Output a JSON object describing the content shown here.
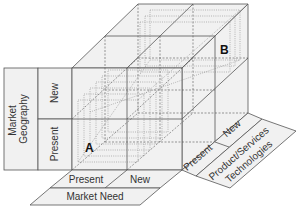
{
  "diagram": {
    "title": "",
    "point_labels": {
      "a": "A",
      "b": "B"
    },
    "axes": {
      "market_geography": {
        "title": "Market Geography",
        "levels": [
          "Present",
          "New"
        ]
      },
      "market_need": {
        "title": "Market Need",
        "levels": [
          "Present",
          "New"
        ]
      },
      "product_technology": {
        "title_line1": "Product/Services",
        "title_line2": "Technologies",
        "levels": [
          "Present",
          "New"
        ]
      }
    }
  }
}
